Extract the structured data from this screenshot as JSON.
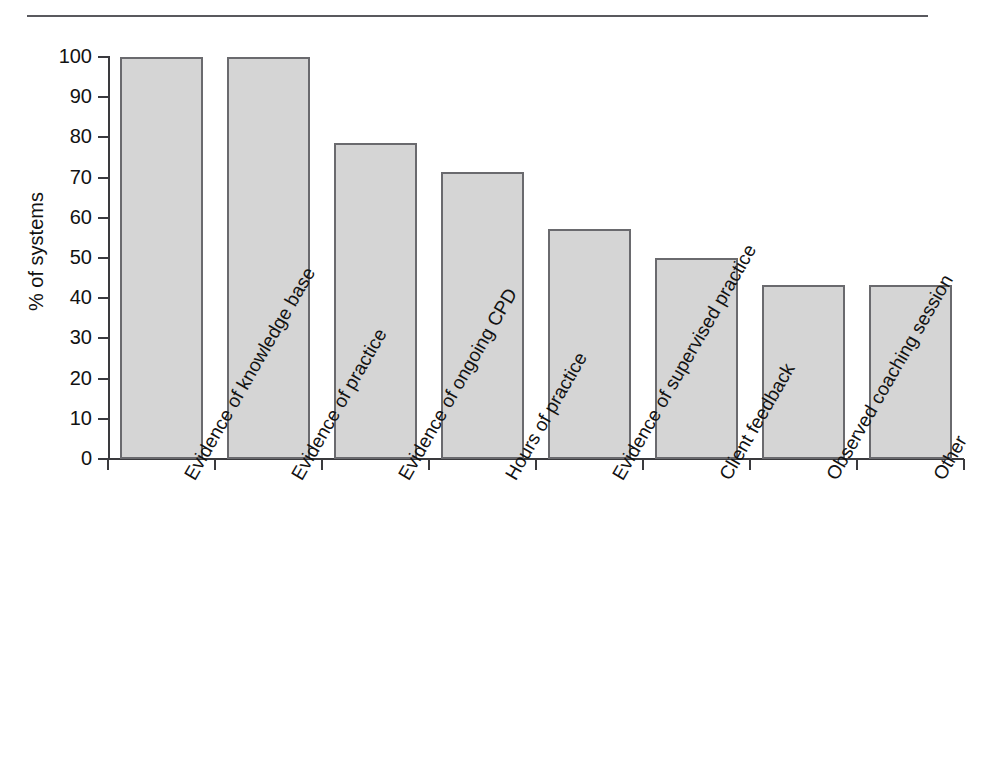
{
  "figure": {
    "title_remnant": "",
    "has_top_rule": true
  },
  "chart_data": {
    "type": "bar",
    "title": "",
    "xlabel": "",
    "ylabel": "% of systems",
    "ylim": [
      0,
      100
    ],
    "ytick_labels": [
      "0",
      "10",
      "20",
      "30",
      "40",
      "50",
      "60",
      "70",
      "80",
      "90",
      "100"
    ],
    "ytick_values": [
      0,
      10,
      20,
      30,
      40,
      50,
      60,
      70,
      80,
      90,
      100
    ],
    "grid": false,
    "legend": null,
    "bar_color": "#d5d5d5",
    "bar_edge_color": "#6a6a6e",
    "categories": [
      "Evidence of knowledge base",
      "Evidence of practice",
      "Evidence of ongoing CPD",
      "Hours of practice",
      "Evidence of supervised practice",
      "Client feedback",
      "Observed coaching session",
      "Other"
    ],
    "values": [
      100,
      100,
      78.6,
      71.4,
      57.1,
      50,
      43.3,
      43.3
    ]
  }
}
